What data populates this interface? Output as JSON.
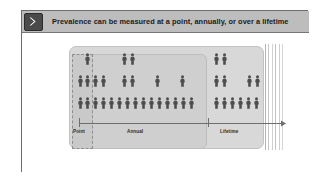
{
  "slide": {
    "header": {
      "icon": "chevron-right-icon",
      "title": "Prevalence can be measured at a point, annually, or over a lifetime"
    },
    "diagram": {
      "type": "pictogram-timeline",
      "bands": [
        {
          "key": "point",
          "label": "Point",
          "style": "dashed-box"
        },
        {
          "key": "annual",
          "label": "Annual",
          "style": "rounded-box"
        },
        {
          "key": "lifetime",
          "label": "Lifetime",
          "style": "rounded-box"
        }
      ],
      "axis": {
        "ticks": [
          "Point",
          "Lifetime"
        ],
        "arrow": "right-arrow-dashed",
        "direction": "time"
      },
      "person_icon": "person-figure-icon",
      "rows": [
        {
          "row": "top",
          "y": 20,
          "people_x": [
            63,
            100,
            108,
            192,
            200
          ]
        },
        {
          "row": "middle",
          "y": 42,
          "people_x": [
            56,
            63,
            71,
            79,
            100,
            108,
            133,
            158,
            192,
            200,
            225,
            233
          ]
        },
        {
          "row": "bottom",
          "y": 64,
          "people_x": [
            56,
            63,
            71,
            79,
            87,
            95,
            103,
            111,
            119,
            127,
            135,
            143,
            151,
            159,
            167,
            192,
            200,
            208,
            216,
            224,
            232
          ]
        }
      ],
      "right_rules_count": 6
    }
  },
  "colors": {
    "header_bar": "#bdbdbd",
    "header_icon": "#4a4a4a",
    "band_lifetime": "#d8d8d8",
    "band_annual": "#cfcfcf",
    "band_point": "#c9c9c9",
    "person": "#4d4d4d",
    "axis": "#6e6e6e",
    "frame": "#6d6d6d",
    "page_background": "#ffffff"
  }
}
